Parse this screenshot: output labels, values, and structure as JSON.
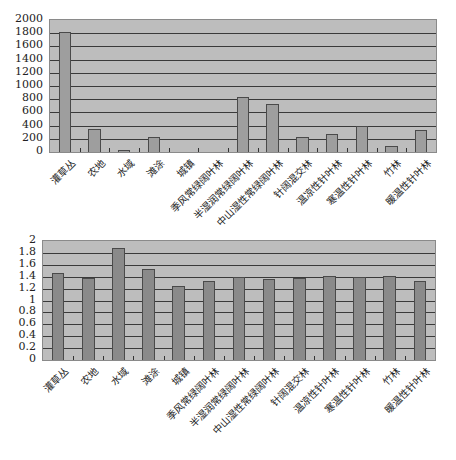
{
  "chart_data": [
    {
      "type": "bar",
      "title": "",
      "xlabel": "",
      "ylabel": "",
      "ylim": [
        0,
        2000
      ],
      "yticks": [
        "0",
        "200",
        "400",
        "600",
        "800",
        "1000",
        "1200",
        "1400",
        "1600",
        "1800",
        "2000"
      ],
      "grid": true,
      "categories": [
        "灌草丛",
        "农地",
        "水域",
        "滩涂",
        "城镇",
        "季风常绿阔叶林",
        "半湿润常绿阔叶林",
        "中山湿性常绿阔叶林",
        "针阔混交林",
        "温凉性针叶林",
        "寒温性针叶林",
        "竹林",
        "暖温性针叶林"
      ],
      "values": [
        1820,
        345,
        30,
        225,
        0,
        0,
        830,
        735,
        225,
        270,
        390,
        90,
        330
      ]
    },
    {
      "type": "bar",
      "title": "",
      "xlabel": "",
      "ylabel": "",
      "ylim": [
        0,
        2
      ],
      "yticks": [
        "0",
        "0.2",
        "0.4",
        "0.6",
        "0.8",
        "1",
        "1.2",
        "1.4",
        "1.6",
        "1.8",
        "2"
      ],
      "grid": true,
      "categories": [
        "灌草丛",
        "农地",
        "水域",
        "滩涂",
        "城镇",
        "季风常绿阔叶林",
        "半湿润常绿阔叶林",
        "中山湿性常绿阔叶林",
        "针阔混交林",
        "温凉性针叶林",
        "寒温性针叶林",
        "竹林",
        "暖温性针叶林"
      ],
      "values": [
        1.47,
        1.38,
        1.88,
        1.53,
        1.25,
        1.32,
        1.4,
        1.37,
        1.38,
        1.42,
        1.39,
        1.42,
        1.33
      ]
    }
  ]
}
